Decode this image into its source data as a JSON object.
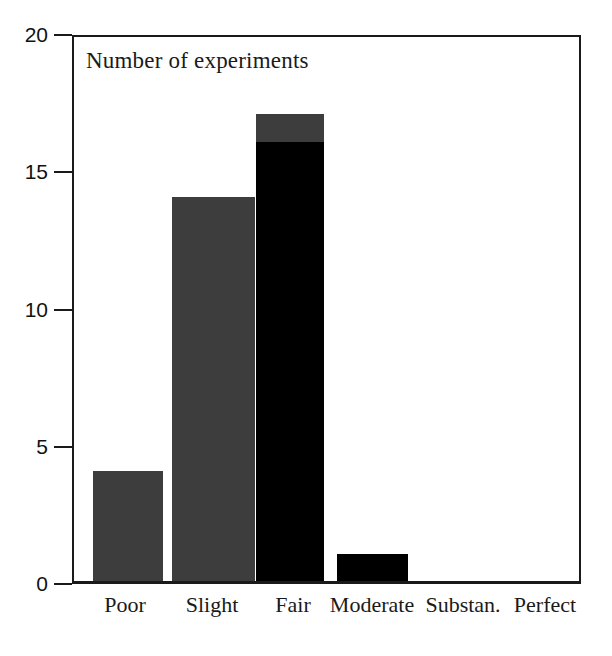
{
  "chart_data": {
    "type": "bar",
    "title": "Number of experiments",
    "subtitle": "",
    "xlabel": "",
    "ylabel": "",
    "categories": [
      "Poor",
      "Slight",
      "Fair",
      "Moderate",
      "Substan.",
      "Perfect"
    ],
    "values": [
      4,
      14,
      17,
      1,
      0,
      0
    ],
    "series": [
      {
        "name": "gray-segment",
        "color": "#3d3d3d",
        "values": [
          4,
          14,
          1,
          0,
          0,
          0
        ]
      },
      {
        "name": "black-segment",
        "color": "#000000",
        "values": [
          0,
          0,
          16,
          1,
          0,
          0
        ]
      }
    ],
    "stacked": true,
    "bar_styles": [
      {
        "category": "Poor",
        "total": 4,
        "black": 0,
        "gray": 4
      },
      {
        "category": "Slight",
        "total": 14,
        "black": 0,
        "gray": 14
      },
      {
        "category": "Fair",
        "total": 17,
        "black": 16,
        "gray": 1
      },
      {
        "category": "Moderate",
        "total": 1,
        "black": 1,
        "gray": 0
      },
      {
        "category": "Substan.",
        "total": 0,
        "black": 0,
        "gray": 0
      },
      {
        "category": "Perfect",
        "total": 0,
        "black": 0,
        "gray": 0
      }
    ],
    "ylim": [
      0,
      20
    ],
    "yticks": [
      0,
      5,
      10,
      15,
      20
    ],
    "ytick_labels": [
      "0",
      "5",
      "10",
      "15",
      "20"
    ],
    "grid": false,
    "legend": null,
    "legend_position": "none",
    "annotations": []
  },
  "axis": {
    "y_ticks": [
      {
        "value": 20,
        "label": "20"
      },
      {
        "value": 15,
        "label": "15"
      },
      {
        "value": 10,
        "label": "10"
      },
      {
        "value": 5,
        "label": "5"
      },
      {
        "value": 0,
        "label": "0"
      }
    ],
    "x_labels": [
      "Poor",
      "Slight",
      "Fair",
      "Moderate",
      "Substan.",
      "Perfect"
    ]
  },
  "colors": {
    "gray_bar": "#3d3d3d",
    "black_bar": "#000000",
    "axis": "#1a1a1a",
    "background": "#ffffff",
    "text": "#111111"
  }
}
